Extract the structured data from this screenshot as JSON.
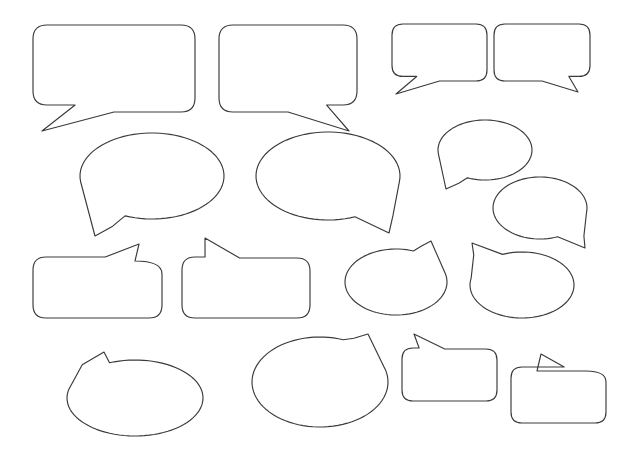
{
  "canvas": {
    "width": 626,
    "height": 464,
    "background_color": "#ffffff",
    "stroke_color": "#3a3a3a",
    "fill_color": "#ffffff",
    "stroke_width": 1.15,
    "title": "Speech Bubble Shapes"
  },
  "shapes": [
    {
      "id": "bubble-rect-large-tail-bottom-left",
      "kind": "rounded-rectangle",
      "tail": "bottom-left",
      "row": 1,
      "column": 1,
      "x": 33,
      "y": 25,
      "width": 162,
      "height": 87,
      "corner_radius": 14,
      "tail_tip_x": 42,
      "tail_tip_y": 131,
      "path": "M 47 25 L 181 25 Q 195 25 195 39 L 195 98 Q 195 112 181 112 L 112 112 L 42 131 L 74 105 L 47 105 Q 33 105 33 91 L 33 39 Q 33 25 47 25 Z"
    },
    {
      "id": "bubble-rect-large-tail-bottom-right",
      "kind": "rounded-rectangle",
      "tail": "bottom-right",
      "row": 1,
      "column": 2,
      "x": 219,
      "y": 25,
      "width": 138,
      "height": 87,
      "corner_radius": 14,
      "tail_tip_x": 349,
      "tail_tip_y": 131,
      "path": "M 233 25 L 343 25 Q 357 25 357 39 L 357 91 Q 357 105 343 105 L 319 105 L 349 131 L 283 112 L 233 112 Q 219 112 219 98 L 219 39 Q 219 25 233 25 Z"
    },
    {
      "id": "bubble-rect-small-tail-bottom-left",
      "kind": "rounded-rectangle",
      "tail": "bottom-left",
      "row": 1,
      "column": 3,
      "x": 392,
      "y": 24,
      "width": 95,
      "height": 57,
      "corner_radius": 11,
      "tail_tip_x": 396,
      "tail_tip_y": 94,
      "path": "M 403 24 L 476 24 Q 487 24 487 35 L 487 70 Q 487 81 476 81 L 431 81 L 396 94 L 414 73 L 403 73 Q 392 73 392 62 L 392 35 Q 392 24 403 24 Z"
    },
    {
      "id": "bubble-rect-small-tail-bottom-right",
      "kind": "rounded-rectangle",
      "tail": "bottom-right",
      "row": 1,
      "column": 4,
      "x": 494,
      "y": 24,
      "width": 96,
      "height": 57,
      "corner_radius": 11,
      "tail_tip_x": 578,
      "tail_tip_y": 92,
      "path": "M 505 24 L 579 24 Q 590 24 590 35 L 590 62 Q 590 73 579 73 L 566 73 L 578 92 L 532 81 L 505 81 Q 494 81 494 70 L 494 35 Q 494 24 505 24 Z"
    },
    {
      "id": "bubble-ellipse-large-tail-bottom-left",
      "kind": "ellipse",
      "tail": "bottom-left",
      "row": 2,
      "column": 1,
      "center_x": 152,
      "center_y": 176,
      "radius_x": 72,
      "radius_y": 43,
      "tail_tip_x": 95,
      "tail_tip_y": 236,
      "path": "M 152 133 C 192 133 224 152 224 176 C 224 200 192 219 152 219 C 132 219 114 214 101 206 L 95 236 L 88 199 C 84 192 80 184 80 176 C 80 152 112 133 152 133 Z"
    },
    {
      "id": "bubble-ellipse-large-tail-bottom-right",
      "kind": "ellipse",
      "tail": "bottom-right",
      "row": 2,
      "column": 2,
      "center_x": 328,
      "center_y": 176,
      "radius_x": 72,
      "radius_y": 44,
      "tail_tip_x": 389,
      "tail_tip_y": 233,
      "path": "M 328 132 C 368 132 400 152 400 176 C 400 186 394 196 385 203 L 389 233 L 357 214 C 348 217 338 220 328 220 C 288 220 256 200 256 176 C 256 152 288 132 328 132 Z"
    },
    {
      "id": "bubble-ellipse-small-tail-bottom-left",
      "kind": "ellipse",
      "tail": "bottom-left",
      "row": 2,
      "column": 3,
      "center_x": 485,
      "center_y": 150,
      "radius_x": 47,
      "radius_y": 30,
      "tail_tip_x": 446,
      "tail_tip_y": 189,
      "path": "M 485 120 C 511 120 532 133 532 150 C 532 167 511 180 485 180 C 472 180 460 177 452 172 L 446 189 L 442 166 C 440 161 438 156 438 150 C 438 133 459 120 485 120 Z"
    },
    {
      "id": "bubble-ellipse-small-tail-bottom-right",
      "kind": "ellipse",
      "tail": "bottom-right",
      "row": 2,
      "column": 4,
      "center_x": 540,
      "center_y": 208,
      "radius_x": 47,
      "radius_y": 31,
      "tail_tip_x": 585,
      "tail_tip_y": 248,
      "path": "M 540 177 C 566 177 587 191 587 208 C 587 214 584 220 580 225 L 585 248 L 564 232 C 557 236 549 239 540 239 C 514 239 493 225 493 208 C 493 191 514 177 540 177 Z"
    },
    {
      "id": "bubble-rect-tail-top-right",
      "kind": "rounded-rectangle",
      "tail": "top-right",
      "row": 3,
      "column": 1,
      "x": 33,
      "y": 257,
      "width": 129,
      "height": 61,
      "corner_radius": 13,
      "tail_tip_x": 139,
      "tail_tip_y": 244,
      "path": "M 46 257 L 106 257 L 139 244 L 135 261 L 149 261 Q 162 261 162 274 L 162 305 Q 162 318 149 318 L 46 318 Q 33 318 33 305 L 33 270 Q 33 257 46 257 Z"
    },
    {
      "id": "bubble-rect-tail-top-left",
      "kind": "rounded-rectangle",
      "tail": "top-left",
      "row": 3,
      "column": 2,
      "x": 182,
      "y": 257,
      "width": 128,
      "height": 61,
      "corner_radius": 13,
      "tail_tip_x": 205,
      "tail_tip_y": 238,
      "path": "M 195 257 L 203 257 L 205 238 L 240 258 L 297 258 Q 310 258 310 271 L 310 305 Q 310 318 297 318 L 195 318 Q 182 318 182 305 L 182 270 Q 182 257 195 257 Z"
    },
    {
      "id": "bubble-ellipse-tail-top-right-mid",
      "kind": "ellipse",
      "tail": "top-right",
      "row": 3,
      "column": 3,
      "center_x": 396,
      "center_y": 282,
      "radius_x": 51,
      "radius_y": 33,
      "tail_tip_x": 431,
      "tail_tip_y": 241,
      "path": "M 396 249 C 406 249 416 250 424 253 L 431 241 L 430 264 C 440 270 447 276 447 282 C 447 300 424 315 396 315 C 368 315 345 300 345 282 C 345 264 368 249 396 249 Z"
    },
    {
      "id": "bubble-ellipse-tail-top-left-mid",
      "kind": "ellipse",
      "tail": "top-left",
      "row": 3,
      "column": 4,
      "center_x": 522,
      "center_y": 285,
      "radius_x": 52,
      "radius_y": 33,
      "tail_tip_x": 472,
      "tail_tip_y": 243,
      "path": "M 522 252 C 550 252 574 267 574 285 C 574 303 550 318 522 318 C 494 318 470 303 470 285 C 470 279 473 273 478 268 L 472 243 L 497 260 C 504 255 512 252 522 252 Z"
    },
    {
      "id": "bubble-ellipse-wide-tail-top-left",
      "kind": "ellipse",
      "tail": "top-left",
      "row": 4,
      "column": 1,
      "center_x": 135,
      "center_y": 398,
      "radius_x": 68,
      "radius_y": 38,
      "tail_tip_x": 104,
      "tail_tip_y": 352,
      "path": "M 135 360 C 160 360 182 367 194 377 L 203 377 C 203 377 203 377 203 377 C 203 377 203 377 203 377 L 135 360 Z"
    },
    {
      "id": "bubble-ellipse-wide-tail-top-right",
      "kind": "ellipse",
      "tail": "top-right",
      "row": 4,
      "column": 2,
      "center_x": 320,
      "center_y": 382,
      "radius_x": 68,
      "radius_y": 45,
      "tail_tip_x": 368,
      "tail_tip_y": 334,
      "path": "M 320 337 Z"
    },
    {
      "id": "bubble-rect-small-tail-top-left",
      "kind": "rounded-rectangle",
      "tail": "top-left",
      "row": 4,
      "column": 3,
      "x": 402,
      "y": 348,
      "width": 95,
      "height": 53,
      "corner_radius": 11,
      "tail_tip_x": 414,
      "tail_tip_y": 334,
      "path": "M 413 348 L 418 348 L 414 334 L 447 349 L 486 349 Q 497 349 497 360 L 497 390 Q 497 401 486 401 L 413 401 Q 402 401 402 390 L 402 359 Q 402 348 413 348 Z"
    },
    {
      "id": "bubble-rect-small-tail-top-right",
      "kind": "rounded-rectangle",
      "tail": "top-right",
      "row": 4,
      "column": 4,
      "x": 511,
      "y": 367,
      "width": 95,
      "height": 56,
      "corner_radius": 11,
      "tail_tip_x": 541,
      "tail_tip_y": 354,
      "path": "M 522 367 L 528 367 L 541 354 L 545 370 L 595 370 Q 606 370 606 381 L 606 412 Q 606 423 595 423 L 522 423 Q 511 423 511 412 L 511 378 Q 511 367 522 367 Z"
    }
  ],
  "summary": {
    "shape_count": 16,
    "rows": 4,
    "description": "Blank speech bubble outlines arranged in a grid"
  }
}
